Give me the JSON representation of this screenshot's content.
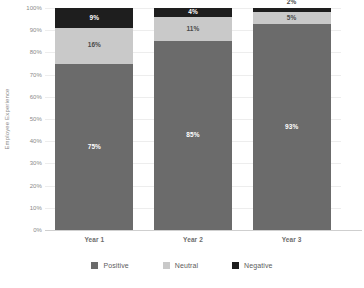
{
  "chart_data": {
    "type": "bar",
    "subtype": "stacked-column-100",
    "title": "",
    "xlabel": "Year",
    "ylabel": "Employee Experience",
    "categories": [
      "Year 1",
      "Year 2",
      "Year 3"
    ],
    "series": [
      {
        "name": "Positive",
        "values": [
          75,
          85,
          93
        ],
        "color": "#6b6b6b"
      },
      {
        "name": "Neutral",
        "values": [
          16,
          11,
          5
        ],
        "color": "#c9c9c9"
      },
      {
        "name": "Negative",
        "values": [
          9,
          4,
          2
        ],
        "color": "#1e1e1e"
      }
    ],
    "ylim": [
      0,
      100
    ],
    "ytick_labels": [
      "0%",
      "10%",
      "20%",
      "30%",
      "40%",
      "50%",
      "60%",
      "70%",
      "80%",
      "90%",
      "100%"
    ],
    "ytick_values": [
      0,
      10,
      20,
      30,
      40,
      50,
      60,
      70,
      80,
      90,
      100
    ],
    "grid": true,
    "legend_position": "bottom",
    "data_labels": {
      "Year 1": {
        "Negative": "9%",
        "Neutral": "16%",
        "Positive": "75%"
      },
      "Year 2": {
        "Negative": "4%",
        "Neutral": "11%",
        "Positive": "85%"
      },
      "Year 3": {
        "Negative": "2%",
        "Neutral": "5%",
        "Positive": "93%"
      }
    }
  },
  "axes": {
    "y_title": "Employee Experience",
    "x_title": "Year",
    "y_ticks": [
      "100%",
      "90%",
      "80%",
      "70%",
      "60%",
      "50%",
      "40%",
      "30%",
      "20%",
      "10%",
      "0%"
    ],
    "x_ticks": [
      "Year 1",
      "Year 2",
      "Year 3"
    ]
  },
  "bars": [
    {
      "category": "Year 1",
      "segments": [
        {
          "series": "Negative",
          "value": 9,
          "label": "9%",
          "label_inside": true,
          "label_on_dark": true
        },
        {
          "series": "Neutral",
          "value": 16,
          "label": "16%",
          "label_inside": true,
          "label_on_dark": false
        },
        {
          "series": "Positive",
          "value": 75,
          "label": "75%",
          "label_inside": true,
          "label_on_dark": true
        }
      ]
    },
    {
      "category": "Year 2",
      "segments": [
        {
          "series": "Negative",
          "value": 4,
          "label": "4%",
          "label_inside": true,
          "label_on_dark": true
        },
        {
          "series": "Neutral",
          "value": 11,
          "label": "11%",
          "label_inside": true,
          "label_on_dark": false
        },
        {
          "series": "Positive",
          "value": 85,
          "label": "85%",
          "label_inside": true,
          "label_on_dark": true
        }
      ]
    },
    {
      "category": "Year 3",
      "segments": [
        {
          "series": "Negative",
          "value": 2,
          "label": "2%",
          "label_inside": false,
          "label_on_dark": false
        },
        {
          "series": "Neutral",
          "value": 5,
          "label": "5%",
          "label_inside": true,
          "label_on_dark": false
        },
        {
          "series": "Positive",
          "value": 93,
          "label": "93%",
          "label_inside": true,
          "label_on_dark": true
        }
      ]
    }
  ],
  "legend": {
    "items": [
      {
        "label": "Positive",
        "color": "#6b6b6b"
      },
      {
        "label": "Neutral",
        "color": "#c9c9c9"
      },
      {
        "label": "Negative",
        "color": "#1e1e1e"
      }
    ]
  },
  "colors": {
    "positive": "#6b6b6b",
    "neutral": "#c9c9c9",
    "negative": "#1e1e1e",
    "gridline": "#ededed",
    "axis": "#cfcfcf",
    "text": "#6d6d6d",
    "background": "#ffffff"
  }
}
